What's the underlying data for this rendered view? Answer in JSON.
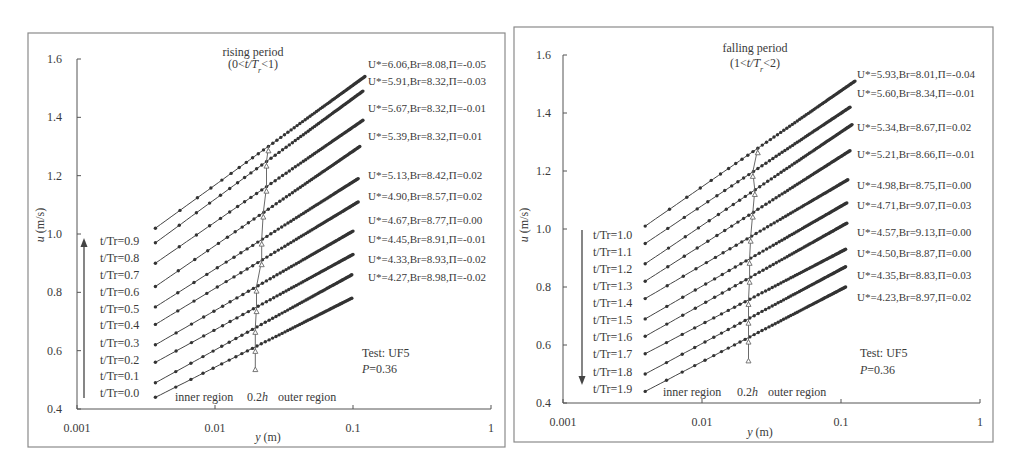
{
  "chart_data": [
    {
      "type": "line",
      "title": "rising period",
      "subtitle": {
        "open": "(0<",
        "var": "t/T",
        "sub": "r",
        "close": "<1)"
      },
      "xlabel": {
        "var": "y",
        "unit": " (m)"
      },
      "ylabel": {
        "var": "u",
        "unit": " (m/s)"
      },
      "xscale": "log",
      "xlim": [
        0.001,
        1
      ],
      "ylim": [
        0.4,
        1.6
      ],
      "xticks": [
        0.001,
        0.01,
        0.1,
        1
      ],
      "xtick_labels": [
        "0.001",
        "0.01",
        "0.1",
        "1"
      ],
      "yticks": [
        0.4,
        0.6,
        0.8,
        1.0,
        1.2,
        1.4,
        1.6
      ],
      "ytick_labels": [
        "0.4",
        "0.6",
        "0.8",
        "1.0",
        "1.2",
        "1.4",
        "1.6"
      ],
      "grid": false,
      "legend": "none",
      "time_arrow": "up",
      "annotations": {
        "test": "Test: UF5",
        "p_var": "P",
        "p_value": "=0.36",
        "inner_region": "inner region",
        "boundary_value": "0.2",
        "boundary_var": "h",
        "outer_region": "outer region"
      },
      "boundary_marker": {
        "position": "0.2h",
        "bottom_u": 0.53
      },
      "series": [
        {
          "name": "t/Tr=0.0",
          "U_star": 4.27,
          "Br": 8.98,
          "Pi": -0.02,
          "label": "U*=4.27,Br=8.98,Π=-0.02",
          "x_start": 0.0037,
          "x_end": 0.098,
          "u_start": 0.44,
          "u_end": 0.78
        },
        {
          "name": "t/Tr=0.1",
          "U_star": 4.33,
          "Br": 8.93,
          "Pi": -0.02,
          "label": "U*=4.33,Br=8.93,Π=-0.02",
          "x_start": 0.0037,
          "x_end": 0.098,
          "u_start": 0.49,
          "u_end": 0.86
        },
        {
          "name": "t/Tr=0.2",
          "U_star": 4.45,
          "Br": 8.91,
          "Pi": -0.01,
          "label": "U*=4.45,Br=8.91,Π=-0.01",
          "x_start": 0.0037,
          "x_end": 0.1,
          "u_start": 0.56,
          "u_end": 0.93
        },
        {
          "name": "t/Tr=0.3",
          "U_star": 4.67,
          "Br": 8.77,
          "Pi": 0.0,
          "label": "U*=4.67,Br=8.77,Π=0.00",
          "x_start": 0.0037,
          "x_end": 0.1,
          "u_start": 0.62,
          "u_end": 1.01
        },
        {
          "name": "t/Tr=0.4",
          "U_star": 4.9,
          "Br": 8.57,
          "Pi": 0.02,
          "label": "U*=4.90,Br=8.57,Π=0.02",
          "x_start": 0.0037,
          "x_end": 0.109,
          "u_start": 0.69,
          "u_end": 1.11
        },
        {
          "name": "t/Tr=0.5",
          "U_star": 5.13,
          "Br": 8.42,
          "Pi": 0.02,
          "label": "U*=5.13,Br=8.42,Π=0.02",
          "x_start": 0.0037,
          "x_end": 0.109,
          "u_start": 0.75,
          "u_end": 1.19
        },
        {
          "name": "t/Tr=0.6",
          "U_star": 5.39,
          "Br": 8.32,
          "Pi": 0.01,
          "label": "U*=5.39,Br=8.32,Π=0.01",
          "x_start": 0.0037,
          "x_end": 0.112,
          "u_start": 0.82,
          "u_end": 1.3
        },
        {
          "name": "t/Tr=0.7",
          "U_star": 5.67,
          "Br": 8.32,
          "Pi": -0.01,
          "label": "U*=5.67,Br=8.32,Π=-0.01",
          "x_start": 0.0037,
          "x_end": 0.118,
          "u_start": 0.9,
          "u_end": 1.39
        },
        {
          "name": "t/Tr=0.8",
          "U_star": 5.91,
          "Br": 8.32,
          "Pi": -0.03,
          "label": "U*=5.91,Br=8.32,Π=-0.03",
          "x_start": 0.0037,
          "x_end": 0.118,
          "u_start": 0.97,
          "u_end": 1.49
        },
        {
          "name": "t/Tr=0.9",
          "U_star": 6.06,
          "Br": 8.08,
          "Pi": -0.05,
          "label": "U*=6.06,Br=8.08,Π=-0.05",
          "x_start": 0.0037,
          "x_end": 0.122,
          "u_start": 1.02,
          "u_end": 1.54
        }
      ]
    },
    {
      "type": "line",
      "title": "falling period",
      "subtitle": {
        "open": "(1<",
        "var": "t/T",
        "sub": "r",
        "close": "<2)"
      },
      "xlabel": {
        "var": "y",
        "unit": " (m)"
      },
      "ylabel": {
        "var": "u",
        "unit": " (m/s)"
      },
      "xscale": "log",
      "xlim": [
        0.001,
        1
      ],
      "ylim": [
        0.4,
        1.6
      ],
      "xticks": [
        0.001,
        0.01,
        0.1,
        1
      ],
      "xtick_labels": [
        "0.001",
        "0.01",
        "0.1",
        "1"
      ],
      "yticks": [
        0.4,
        0.6,
        0.8,
        1.0,
        1.2,
        1.4,
        1.6
      ],
      "ytick_labels": [
        "0.4",
        "0.6",
        "0.8",
        "1.0",
        "1.2",
        "1.4",
        "1.6"
      ],
      "grid": false,
      "legend": "none",
      "time_arrow": "down",
      "annotations": {
        "test": "Test: UF5",
        "p_var": "P",
        "p_value": "=0.36",
        "inner_region": "inner region",
        "boundary_value": "0.2",
        "boundary_var": "h",
        "outer_region": "outer region"
      },
      "boundary_marker": {
        "position": "0.2h",
        "bottom_u": 0.54
      },
      "series": [
        {
          "name": "t/Tr=1.0",
          "U_star": 5.93,
          "Br": 8.01,
          "Pi": -0.04,
          "label": "U*=5.93,Br=8.01,Π=-0.04",
          "x_start": 0.0039,
          "x_end": 0.126,
          "u_start": 1.01,
          "u_end": 1.51
        },
        {
          "name": "t/Tr=1.1",
          "U_star": 5.6,
          "Br": 8.34,
          "Pi": -0.01,
          "label": "U*=5.60,Br=8.34,Π=-0.01",
          "x_start": 0.0039,
          "x_end": 0.116,
          "u_start": 0.95,
          "u_end": 1.42
        },
        {
          "name": "t/Tr=1.2",
          "U_star": 5.34,
          "Br": 8.67,
          "Pi": 0.02,
          "label": "U*=5.34,Br=8.67,Π=0.02",
          "x_start": 0.0039,
          "x_end": 0.12,
          "u_start": 0.88,
          "u_end": 1.36
        },
        {
          "name": "t/Tr=1.3",
          "U_star": 5.21,
          "Br": 8.66,
          "Pi": -0.01,
          "label": "U*=5.21,Br=8.66,Π=-0.01",
          "x_start": 0.0039,
          "x_end": 0.116,
          "u_start": 0.82,
          "u_end": 1.27
        },
        {
          "name": "t/Tr=1.4",
          "U_star": 4.98,
          "Br": 8.75,
          "Pi": 0.0,
          "label": "U*=4.98,Br=8.75,Π=0.00",
          "x_start": 0.0039,
          "x_end": 0.112,
          "u_start": 0.76,
          "u_end": 1.17
        },
        {
          "name": "t/Tr=1.5",
          "U_star": 4.71,
          "Br": 9.07,
          "Pi": 0.03,
          "label": "U*=4.71,Br=9.07,Π=0.03",
          "x_start": 0.0039,
          "x_end": 0.11,
          "u_start": 0.69,
          "u_end": 1.09
        },
        {
          "name": "t/Tr=1.6",
          "U_star": 4.57,
          "Br": 9.13,
          "Pi": 0.0,
          "label": "U*=4.57,Br=9.13,Π=0.00",
          "x_start": 0.0039,
          "x_end": 0.11,
          "u_start": 0.63,
          "u_end": 1.02
        },
        {
          "name": "t/Tr=1.7",
          "U_star": 4.5,
          "Br": 8.87,
          "Pi": 0.0,
          "label": "U*=4.50,Br=8.87,Π=0.00",
          "x_start": 0.0039,
          "x_end": 0.108,
          "u_start": 0.57,
          "u_end": 0.93
        },
        {
          "name": "t/Tr=1.8",
          "U_star": 4.35,
          "Br": 8.83,
          "Pi": 0.03,
          "label": "U*=4.35,Br=8.83,Π=0.03",
          "x_start": 0.0039,
          "x_end": 0.108,
          "u_start": 0.5,
          "u_end": 0.87
        },
        {
          "name": "t/Tr=1.9",
          "U_star": 4.23,
          "Br": 8.97,
          "Pi": 0.02,
          "label": "U*=4.23,Br=8.97,Π=0.02",
          "x_start": 0.0039,
          "x_end": 0.108,
          "u_start": 0.44,
          "u_end": 0.8
        }
      ]
    }
  ]
}
